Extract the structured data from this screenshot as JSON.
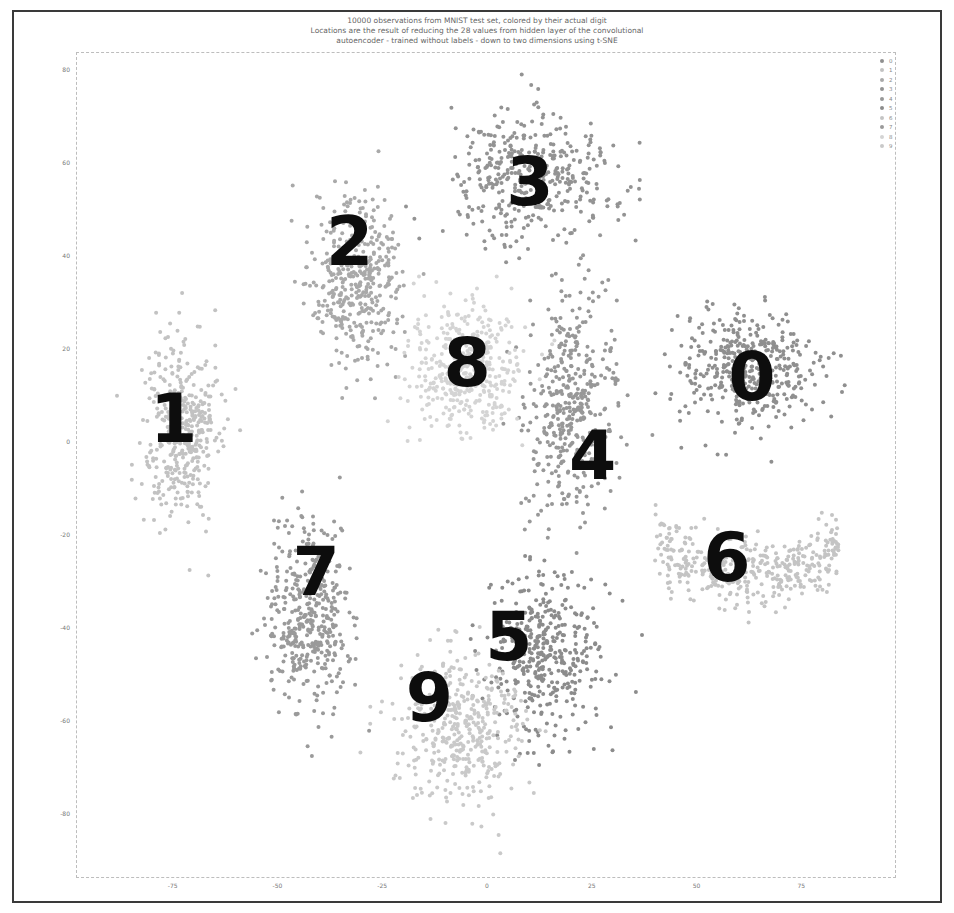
{
  "chart_data": {
    "type": "scatter",
    "title": "10000 observations from MNIST test set, colored by their actual digit",
    "subtitle": [
      "Locations are the result of reducing the 28 values from hidden layer of the convolutional",
      "autoencoder - trained without labels - down to two dimensions using t-SNE"
    ],
    "xlabel": "",
    "ylabel": "",
    "xlim": [
      -90,
      97
    ],
    "ylim": [
      -92,
      85
    ],
    "x_ticks": [
      -75,
      -50,
      -25,
      0,
      25,
      50,
      75
    ],
    "y_ticks": [
      80,
      60,
      40,
      20,
      0,
      -20,
      -40,
      -60,
      -80
    ],
    "grid": false,
    "legend_position": "upper right",
    "legend": [
      "0",
      "1",
      "2",
      "3",
      "4",
      "5",
      "6",
      "7",
      "8",
      "9"
    ],
    "series": [
      {
        "name": "0",
        "color": "#8f8f8f",
        "center": [
          62,
          16
        ],
        "spread": [
          15,
          11
        ],
        "annotation": "0"
      },
      {
        "name": "1",
        "color": "#c2c2c2",
        "center": [
          -73,
          3
        ],
        "spread": [
          8,
          18
        ],
        "annotation": "1"
      },
      {
        "name": "2",
        "color": "#a9a9a9",
        "center": [
          -31,
          35
        ],
        "spread": [
          10,
          16
        ],
        "annotation": "2"
      },
      {
        "name": "3",
        "color": "#939393",
        "center": [
          10,
          57
        ],
        "spread": [
          18,
          12
        ],
        "annotation": "3"
      },
      {
        "name": "4",
        "color": "#989898",
        "center": [
          20,
          8
        ],
        "spread": [
          10,
          20
        ],
        "annotation": "4"
      },
      {
        "name": "5",
        "color": "#8c8c8c",
        "center": [
          14,
          -45
        ],
        "spread": [
          13,
          16
        ],
        "annotation": "5"
      },
      {
        "name": "6",
        "color": "#c4c4c4",
        "center": [
          62,
          -24
        ],
        "spread": [
          22,
          7
        ],
        "annotation": "6"
      },
      {
        "name": "7",
        "color": "#9a9a9a",
        "center": [
          -43,
          -38
        ],
        "spread": [
          9,
          18
        ],
        "annotation": "7"
      },
      {
        "name": "8",
        "color": "#d4d4d4",
        "center": [
          -5,
          15
        ],
        "spread": [
          12,
          13
        ],
        "annotation": "8"
      },
      {
        "name": "9",
        "color": "#c9c9c9",
        "center": [
          -7,
          -62
        ],
        "spread": [
          14,
          16
        ],
        "annotation": "9"
      }
    ],
    "annotations": [
      {
        "text": "0",
        "x": 63,
        "y": 14
      },
      {
        "text": "1",
        "x": -75,
        "y": 5
      },
      {
        "text": "2",
        "x": -33,
        "y": 43
      },
      {
        "text": "3",
        "x": 10,
        "y": 56
      },
      {
        "text": "4",
        "x": 25,
        "y": -3
      },
      {
        "text": "5",
        "x": 5,
        "y": -42
      },
      {
        "text": "6",
        "x": 57,
        "y": -25
      },
      {
        "text": "7",
        "x": -41,
        "y": -28
      },
      {
        "text": "8",
        "x": -5,
        "y": 17
      },
      {
        "text": "9",
        "x": -14,
        "y": -55
      }
    ]
  }
}
